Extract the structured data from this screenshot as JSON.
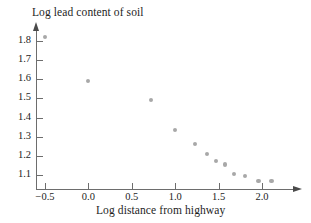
{
  "chart_data": {
    "type": "scatter",
    "title": "Log lead content of soil",
    "xlabel": "Log distance from highway",
    "ylabel": "Log lead content of soil",
    "grid": false,
    "legend": "none",
    "xlim": [
      -0.72,
      2.24
    ],
    "ylim": [
      1.04,
      1.88
    ],
    "xticks": [
      -0.5,
      0.0,
      0.5,
      1.0,
      1.5,
      2.0
    ],
    "xtick_labels": [
      "−0.5",
      "0.0",
      "0.5",
      "1.0",
      "1.5",
      "2.0"
    ],
    "yticks": [
      1.1,
      1.2,
      1.3,
      1.4,
      1.5,
      1.6,
      1.7,
      1.8
    ],
    "ytick_labels": [
      "1.1",
      "1.2",
      "1.3",
      "1.4",
      "1.5",
      "1.6",
      "1.7",
      "1.8"
    ],
    "point_color": "#a8a8a8",
    "axis_color": "#6d6d6d",
    "x": [
      -0.5,
      0.0,
      0.72,
      1.0,
      1.23,
      1.37,
      1.47,
      1.57,
      1.68,
      1.8,
      1.96,
      2.11
    ],
    "y": [
      1.82,
      1.59,
      1.49,
      1.335,
      1.26,
      1.21,
      1.175,
      1.155,
      1.105,
      1.095,
      1.07,
      1.07
    ],
    "points": [
      {
        "x": -0.5,
        "y": 1.82
      },
      {
        "x": 0.0,
        "y": 1.59
      },
      {
        "x": 0.72,
        "y": 1.49
      },
      {
        "x": 1.0,
        "y": 1.335
      },
      {
        "x": 1.23,
        "y": 1.26
      },
      {
        "x": 1.37,
        "y": 1.21
      },
      {
        "x": 1.47,
        "y": 1.175
      },
      {
        "x": 1.57,
        "y": 1.155
      },
      {
        "x": 1.68,
        "y": 1.105
      },
      {
        "x": 1.8,
        "y": 1.095
      },
      {
        "x": 1.96,
        "y": 1.07
      },
      {
        "x": 2.11,
        "y": 1.07
      }
    ]
  }
}
